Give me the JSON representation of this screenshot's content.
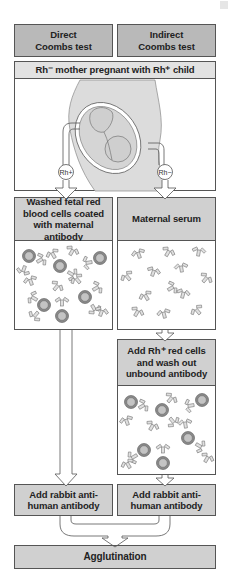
{
  "header": {
    "direct": "Direct\nCoombs test",
    "indirect": "Indirect\nCoombs test"
  },
  "scenario": "Rh⁻ mother pregnant with Rh⁺ child",
  "labels": {
    "rh_pos": "Rh+",
    "rh_neg": "Rh−"
  },
  "direct_steps": {
    "step1": "Washed fetal red blood cells coated with maternal antibody",
    "step2": "Add rabbit anti-human antibody"
  },
  "indirect_steps": {
    "step1": "Maternal serum",
    "step2": "Add Rh⁺ red cells and wash out unbound antibody",
    "step3": "Add rabbit anti-human antibody"
  },
  "result": "Agglutination",
  "colors": {
    "header_fill": "#b9b9b9",
    "step_fill": "#d0d0d0",
    "scenario_fill": "#e2e2e2",
    "border": "#555555"
  }
}
